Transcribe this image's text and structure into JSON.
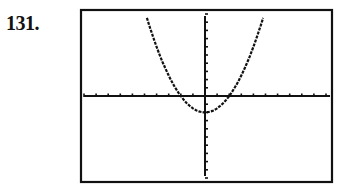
{
  "problem": {
    "number": "131."
  },
  "chart_data": {
    "type": "line",
    "title": "",
    "xlabel": "",
    "ylabel": "",
    "xlim": [
      -10,
      10
    ],
    "ylim": [
      -10,
      10
    ],
    "xscl": 1,
    "yscl": 1,
    "grid": false,
    "legend": "none",
    "series": [
      {
        "name": "parabola",
        "equation": "y = 0.5x^2 - 2",
        "x": [
          -6,
          -5,
          -4,
          -3,
          -2,
          -1,
          0,
          1,
          2,
          3,
          4,
          5,
          6
        ],
        "values": [
          16,
          10.5,
          6,
          2.5,
          0,
          -1.5,
          -2,
          -1.5,
          0,
          2.5,
          6,
          10.5,
          16
        ]
      }
    ],
    "annotations": [
      "vertex near (0, -2)",
      "x-intercepts near x = -2 and x = 2"
    ]
  },
  "colors": {
    "ink": "#111111",
    "background": "#ffffff"
  }
}
